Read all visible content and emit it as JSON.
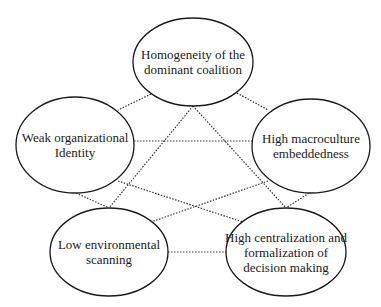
{
  "diagram": {
    "nodes": [
      {
        "id": "homogeneity",
        "lines": [
          "Homogeneity of the",
          "dominant coalition"
        ],
        "cx": 193,
        "cy": 62,
        "rx": 60,
        "ry": 44
      },
      {
        "id": "weak-identity",
        "lines": [
          "Weak organizational",
          "Identity"
        ],
        "cx": 75,
        "cy": 145,
        "rx": 59,
        "ry": 48
      },
      {
        "id": "macroculture",
        "lines": [
          "High macroculture",
          "embeddedness"
        ],
        "cx": 311,
        "cy": 146,
        "rx": 59,
        "ry": 47
      },
      {
        "id": "low-scanning",
        "lines": [
          "Low environmental",
          "scanning"
        ],
        "cx": 109,
        "cy": 252,
        "rx": 59,
        "ry": 44
      },
      {
        "id": "centralization",
        "lines": [
          "High centralization and",
          "formalization of",
          "decision making"
        ],
        "cx": 286,
        "cy": 252,
        "rx": 60,
        "ry": 44
      }
    ],
    "edges": [
      {
        "from": "homogeneity",
        "to": "weak-identity",
        "x1": 151,
        "y1": 94,
        "x2": 118,
        "y2": 110
      },
      {
        "from": "homogeneity",
        "to": "macroculture",
        "x1": 237,
        "y1": 93,
        "x2": 268,
        "y2": 110
      },
      {
        "from": "homogeneity",
        "to": "low-scanning",
        "x1": 193,
        "y1": 106,
        "x2": 109,
        "y2": 208
      },
      {
        "from": "homogeneity",
        "to": "centralization",
        "x1": 193,
        "y1": 106,
        "x2": 286,
        "y2": 208
      },
      {
        "from": "weak-identity",
        "to": "macroculture",
        "x1": 134,
        "y1": 141,
        "x2": 252,
        "y2": 141
      },
      {
        "from": "weak-identity",
        "to": "centralization",
        "x1": 118,
        "y1": 181,
        "x2": 243,
        "y2": 222
      },
      {
        "from": "weak-identity",
        "to": "low-scanning",
        "x1": 76,
        "y1": 193,
        "x2": 109,
        "y2": 208
      },
      {
        "from": "macroculture",
        "to": "low-scanning",
        "x1": 268,
        "y1": 181,
        "x2": 151,
        "y2": 222
      },
      {
        "from": "macroculture",
        "to": "centralization",
        "x1": 309,
        "y1": 193,
        "x2": 286,
        "y2": 208
      },
      {
        "from": "low-scanning",
        "to": "centralization",
        "x1": 168,
        "y1": 252,
        "x2": 226,
        "y2": 252
      }
    ]
  }
}
